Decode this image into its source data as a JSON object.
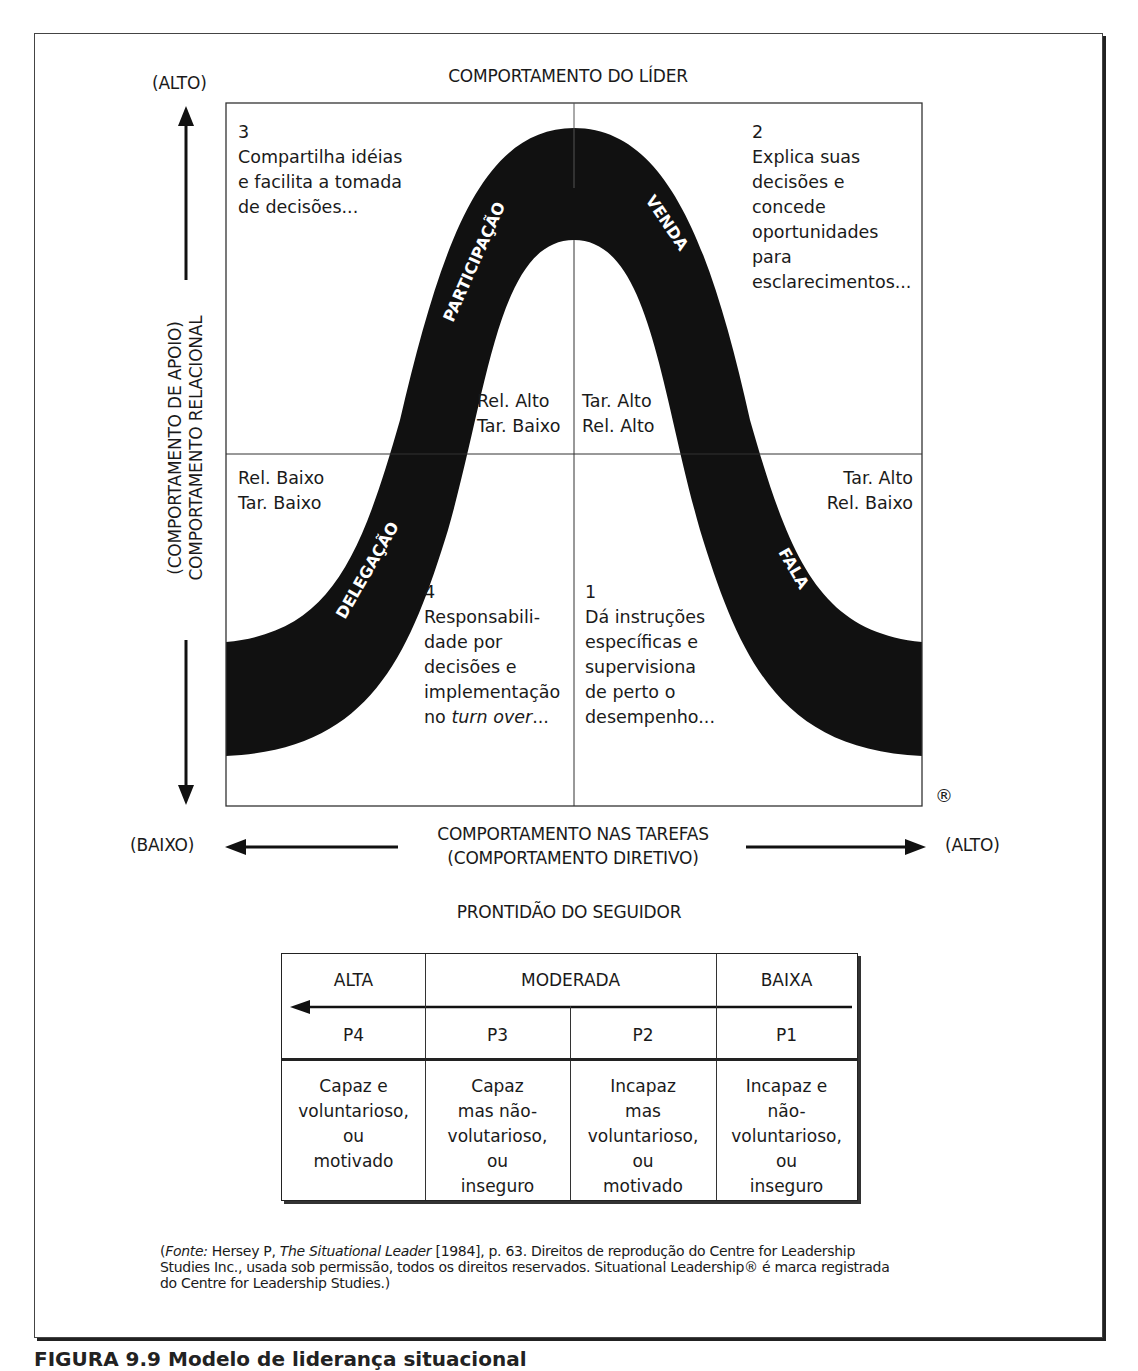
{
  "diagram": {
    "title": "COMPORTAMENTO DO LÍDER",
    "y_axis": {
      "high_label": "(ALTO)",
      "label_line1": "(COMPORTAMENTO DE APOIO)",
      "label_line2": "COMPORTAMENTO RELACIONAL"
    },
    "x_axis": {
      "low_label": "(BAIXO)",
      "high_label": "(ALTO)",
      "label_line1": "COMPORTAMENTO NAS TAREFAS",
      "label_line2": "(COMPORTAMENTO DIRETIVO)"
    },
    "registered_mark": "®",
    "curve_labels": {
      "s1": "FALA",
      "s2": "VENDA",
      "s3": "PARTICIPAÇÃO",
      "s4": "DELEGAÇÃO"
    },
    "quadrants": {
      "q3": {
        "number": "3",
        "lines": [
          "Compartilha idéias",
          "e facilita a tomada",
          "de decisões..."
        ],
        "tag": [
          "Rel. Alto",
          "Tar. Baixo"
        ]
      },
      "q2": {
        "number": "2",
        "lines": [
          "Explica suas",
          "decisões e",
          "concede",
          "oportunidades",
          "para",
          "esclarecimentos..."
        ],
        "tag": [
          "Tar. Alto",
          "Rel. Alto"
        ]
      },
      "q4": {
        "number": "4",
        "lines": [
          "Responsabili-",
          "dade por",
          "decisões e",
          "implementação"
        ],
        "last_prefix": "no ",
        "last_italic": "turn over",
        "last_suffix": "...",
        "tag": [
          "Rel. Baixo",
          "Tar. Baixo"
        ]
      },
      "q1": {
        "number": "1",
        "lines": [
          "Dá instruções",
          "específicas e",
          "supervisiona",
          "de perto o",
          "desempenho..."
        ],
        "tag": [
          "Tar. Alto",
          "Rel. Baixo"
        ]
      }
    }
  },
  "readiness": {
    "title": "PRONTIDÃO DO SEGUIDOR",
    "levels": [
      "ALTA",
      "MODERADA",
      "BAIXA"
    ],
    "codes": [
      "P4",
      "P3",
      "P2",
      "P1"
    ],
    "descriptions": [
      [
        "Capaz e",
        "voluntarioso,",
        "ou",
        "motivado"
      ],
      [
        "Capaz",
        "mas não-",
        "volutarioso,",
        "ou",
        "inseguro"
      ],
      [
        "Incapaz",
        "mas",
        "voluntarioso,",
        "ou",
        "motivado"
      ],
      [
        "Incapaz e",
        "não-",
        "voluntarioso,",
        "ou",
        "inseguro"
      ]
    ]
  },
  "source": {
    "open": "(",
    "fonte_label": "Fonte:",
    "author": " Hersey P, ",
    "book_title": "The Situational Leader",
    "rest_line1": " [1984], p. 63. Direitos de reprodução do Centre for Leadership",
    "line2": "Studies Inc., usada sob permissão, todos os direitos reservados. Situational Leadership® é marca registrada",
    "line3": "do Centre for Leadership Studies.)"
  },
  "figure_caption": "FIGURA 9.9  Modelo de liderança situacional"
}
